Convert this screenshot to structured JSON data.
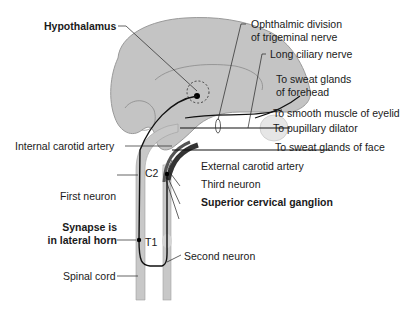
{
  "diagram": {
    "colors": {
      "brain": "#c4c4c4",
      "brain_outline": "#9a9a9a",
      "cord": "#c8c8c8",
      "artery_dark": "#3a3a3a",
      "nerve": "#111111",
      "eye": "#e6e6e6"
    },
    "labels": {
      "hypothalamus": "Hypothalamus",
      "ophthalmic_1": "Ophthalmic division",
      "ophthalmic_2": "of trigeminal nerve",
      "long_ciliary": "Long ciliary nerve",
      "sweat_forehead_1": "To sweat glands",
      "sweat_forehead_2": "of forehead",
      "smooth_muscle": "To smooth muscle of eyelid",
      "pupillary": "To pupillary dilator",
      "sweat_face": "To sweat glands of face",
      "internal_carotid": "Internal carotid artery",
      "external_carotid": "External carotid artery",
      "third_neuron": "Third neuron",
      "superior_cervical": "Superior cervical ganglion",
      "first_neuron": "First neuron",
      "c2": "C2",
      "synapse_1": "Synapse is",
      "synapse_2": "in lateral horn",
      "t1": "T1",
      "second_neuron": "Second neuron",
      "spinal_cord": "Spinal cord"
    }
  }
}
